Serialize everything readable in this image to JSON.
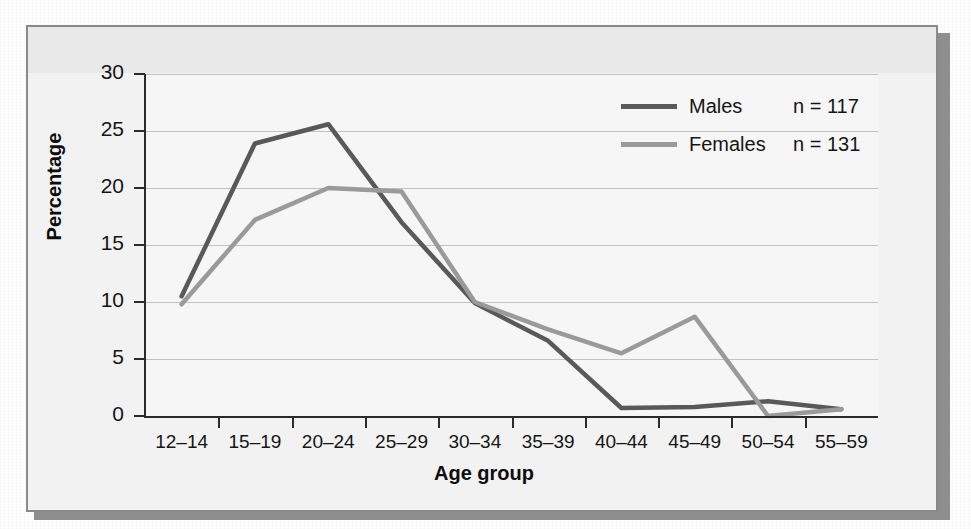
{
  "chart_data": {
    "type": "line",
    "title": "",
    "xlabel": "Age group",
    "ylabel": "Percentage",
    "categories": [
      "12–14",
      "15–19",
      "20–24",
      "25–29",
      "30–34",
      "35–39",
      "40–44",
      "45–49",
      "50–54",
      "55–59"
    ],
    "yticks": [
      0,
      5,
      10,
      15,
      20,
      25,
      30
    ],
    "ylim": [
      0,
      30
    ],
    "grid": true,
    "legend_position": "top-right",
    "series": [
      {
        "name": "Males",
        "n_label": "n = 117",
        "n": 117,
        "color": "#595959",
        "values": [
          10.5,
          23.9,
          25.6,
          17.0,
          9.9,
          6.6,
          0.7,
          0.8,
          1.3,
          0.6
        ]
      },
      {
        "name": "Females",
        "n_label": "n = 131",
        "n": 131,
        "color": "#9a9a9a",
        "values": [
          9.8,
          17.2,
          20.0,
          19.7,
          10.0,
          7.6,
          5.5,
          8.7,
          0.0,
          0.6
        ]
      }
    ]
  },
  "axes": {
    "ylabel": "Percentage",
    "xlabel": "Age group",
    "ytick_labels": [
      "30",
      "25",
      "20",
      "15",
      "10",
      "5",
      "0"
    ],
    "xtick_labels": [
      "12–14",
      "15–19",
      "20–24",
      "25–29",
      "30–34",
      "35–39",
      "40–44",
      "45–49",
      "50–54",
      "55–59"
    ]
  },
  "legend": {
    "rows": [
      {
        "name": "Males",
        "n_label": "n = 117",
        "color": "#595959"
      },
      {
        "name": "Females",
        "n_label": "n = 131",
        "color": "#9a9a9a"
      }
    ]
  },
  "bleed_through": {
    "text": "                                                                                                                                        \n                                                                                                    \n                                                                                                                \n                                                                                                          \n                                                                                                      \n                                                                                                                \n                                                                                                     \n                                                                                                              \n                                                                                                            "
  },
  "colors": {
    "males_line": "#595959",
    "females_line": "#9a9a9a",
    "axis": "#2b2b2b",
    "gridline": "#c2c2c2",
    "figure_border": "#8a8a8a",
    "figure_background": "#f2f2f2",
    "plot_background": "#f6f6f6",
    "shadow": "#8e8e8e"
  }
}
